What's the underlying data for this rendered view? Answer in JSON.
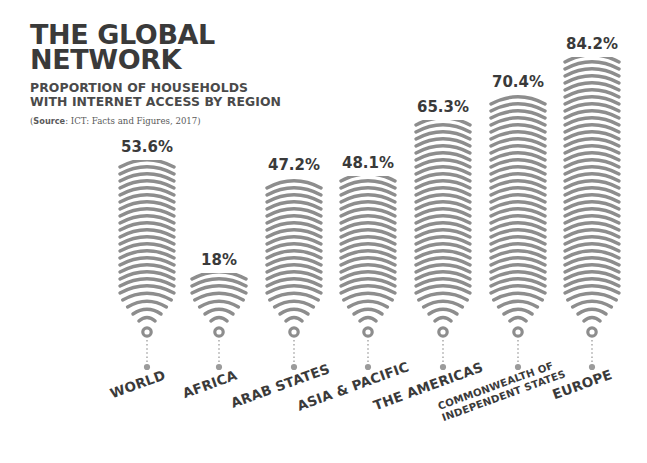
{
  "header": {
    "title_line1": "THE GLOBAL",
    "title_line2": "NETWORK",
    "subtitle_line1": "PROPORTION OF HOUSEHOLDS",
    "subtitle_line2": "WITH INTERNET ACCESS BY REGION",
    "source_label": "Source",
    "source_text": ": ICT: Facts and Figures, 2017)",
    "source_open": "("
  },
  "colors": {
    "arc": "#8d8d8d",
    "arc_light": "#a5a5a5",
    "text": "#3a3a3a",
    "leader": "#9b9b9b",
    "background": "#ffffff"
  },
  "chart_data": {
    "type": "bar",
    "title": "THE GLOBAL NETWORK",
    "subtitle": "PROPORTION OF HOUSEHOLDS WITH INTERNET ACCESS BY REGION",
    "source": "(Source: ICT: Facts and Figures, 2017)",
    "xlabel": "",
    "ylabel": "Proportion of households with internet access (%)",
    "ylim": [
      0,
      100
    ],
    "grid": false,
    "legend": false,
    "unit": "%",
    "categories": [
      "WORLD",
      "AFRICA",
      "ARAB STATES",
      "ASIA & PACIFIC",
      "THE AMERICAS",
      "COMMONWEALTH OF INDEPENDENT STATES",
      "EUROPE"
    ],
    "values": [
      53.6,
      18,
      47.2,
      48.1,
      65.3,
      70.4,
      84.2
    ],
    "value_labels": [
      "53.6%",
      "18%",
      "47.2%",
      "48.1%",
      "65.3%",
      "70.4%",
      "84.2%"
    ]
  },
  "bars": [
    {
      "label": "WORLD",
      "label_l1": "WORLD",
      "label_l2": "",
      "value": "53.6%",
      "cx": 147,
      "top": 160,
      "two_line": false
    },
    {
      "label": "AFRICA",
      "label_l1": "AFRICA",
      "label_l2": "",
      "value": "18%",
      "cx": 219,
      "top": 273,
      "two_line": false
    },
    {
      "label": "ARAB STATES",
      "label_l1": "ARAB STATES",
      "label_l2": "",
      "value": "47.2%",
      "cx": 294,
      "top": 178,
      "two_line": false
    },
    {
      "label": "ASIA & PACIFIC",
      "label_l1": "ASIA & PACIFIC",
      "label_l2": "",
      "value": "48.1%",
      "cx": 368,
      "top": 176,
      "two_line": false
    },
    {
      "label": "THE AMERICAS",
      "label_l1": "THE AMERICAS",
      "label_l2": "",
      "value": "65.3%",
      "cx": 443,
      "top": 120,
      "two_line": false
    },
    {
      "label": "COMMONWEALTH OF INDEPENDENT STATES",
      "label_l1": "COMMONWEALTH OF",
      "label_l2": "INDEPENDENT STATES",
      "value": "70.4%",
      "cx": 518,
      "top": 95,
      "two_line": true
    },
    {
      "label": "EUROPE",
      "label_l1": "EUROPE",
      "label_l2": "",
      "value": "84.2%",
      "cx": 592,
      "top": 57,
      "two_line": false
    }
  ]
}
